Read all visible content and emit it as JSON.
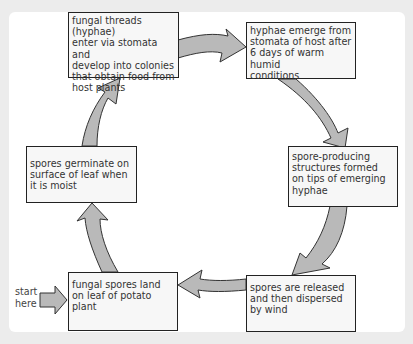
{
  "diagram": {
    "type": "cycle",
    "start_label": "start\nhere",
    "steps": [
      {
        "id": 1,
        "text": "fungal spores land\non leaf of potato\nplant"
      },
      {
        "id": 2,
        "text": "spores germinate on\nsurface of leaf when\nit is moist"
      },
      {
        "id": 3,
        "text": "fungal threads (hyphae)\nenter via stomata and\ndevelop into colonies\nthat obtain food from\nhost plants"
      },
      {
        "id": 4,
        "text": "hyphae emerge from\nstomata of host after\n6 days of warm humid\nconditions"
      },
      {
        "id": 5,
        "text": "spore-producing\nstructures formed\non tips of emerging\nhyphae"
      },
      {
        "id": 6,
        "text": "spores are released\nand then dispersed\nby wind"
      }
    ],
    "flow": [
      {
        "from": "start",
        "to": 1
      },
      {
        "from": 1,
        "to": 2
      },
      {
        "from": 2,
        "to": 3
      },
      {
        "from": 3,
        "to": 4
      },
      {
        "from": 4,
        "to": 5
      },
      {
        "from": 5,
        "to": 6
      },
      {
        "from": 6,
        "to": 1
      }
    ],
    "colors": {
      "background": "#ececec",
      "panel": "#ffffff",
      "box_fill": "#f7f7f7",
      "box_border": "#222222",
      "arrow_fill": "#b9b9b9",
      "arrow_stroke": "#333333",
      "text": "#333333"
    }
  }
}
